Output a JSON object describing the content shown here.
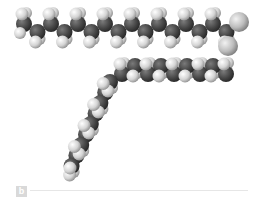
{
  "figure": {
    "type": "space-filling molecular model",
    "panel_label": "b",
    "colors": {
      "carbon": "#4a4a4a",
      "hydrogen": "#d8d8d8",
      "oxygen": "#bdbdbd",
      "background": "#ffffff",
      "label_bg": "#d9d9d9",
      "rule": "#e6e6e6"
    },
    "chains": [
      {
        "name": "upper-chain",
        "orientation": "horizontal",
        "carbons": 16
      },
      {
        "name": "lower-chain",
        "orientation": "bent",
        "carbons": 18
      }
    ]
  }
}
